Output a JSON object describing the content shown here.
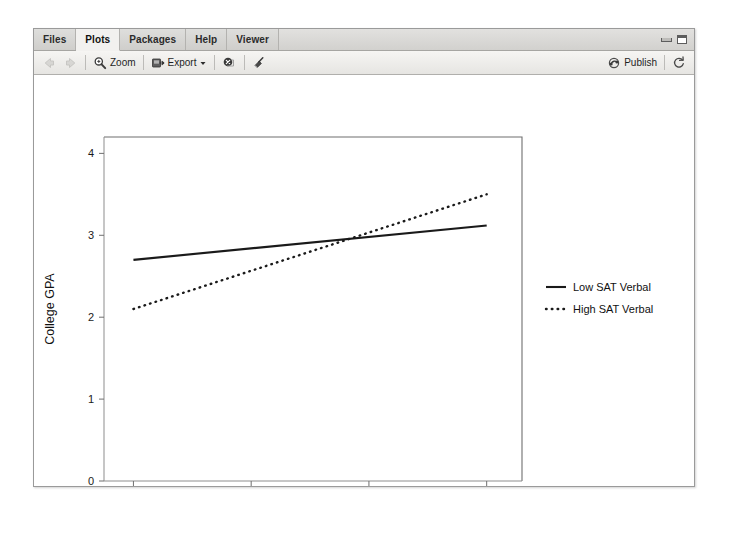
{
  "window": {
    "tabs": [
      {
        "label": "Files",
        "active": false
      },
      {
        "label": "Plots",
        "active": true
      },
      {
        "label": "Packages",
        "active": false
      },
      {
        "label": "Help",
        "active": false
      },
      {
        "label": "Viewer",
        "active": false
      }
    ],
    "minimize_icon": "minimize-icon",
    "maximize_icon": "maximize-icon"
  },
  "toolbar": {
    "back_icon": "back-arrow-icon",
    "forward_icon": "forward-arrow-icon",
    "zoom_label": "Zoom",
    "zoom_icon": "magnifier-icon",
    "export_label": "Export",
    "export_icon": "export-icon",
    "export_caret": "chevron-down-icon",
    "remove_plot_icon": "remove-plot-icon",
    "clear_plots_icon": "broom-icon",
    "publish_label": "Publish",
    "publish_icon": "publish-icon",
    "refresh_icon": "refresh-icon"
  },
  "chart_data": {
    "type": "line",
    "title": "",
    "xlabel": "SAT Math",
    "ylabel": "College GPA",
    "xlim": [
      150,
      860
    ],
    "ylim": [
      0,
      4.2
    ],
    "xticks": [
      200,
      400,
      600,
      800
    ],
    "yticks": [
      0,
      1,
      2,
      3,
      4
    ],
    "xtick_labels": [
      "200",
      "400",
      "600",
      "800"
    ],
    "ytick_labels": [
      "0",
      "1",
      "2",
      "3",
      "4"
    ],
    "grid": false,
    "legend_position": "right",
    "series": [
      {
        "name": "Low SAT Verbal",
        "style": "solid",
        "color": "#1a1a1a",
        "x": [
          200,
          800
        ],
        "y": [
          2.7,
          3.12
        ]
      },
      {
        "name": "High SAT Verbal",
        "style": "dotted",
        "color": "#1a1a1a",
        "x": [
          200,
          800
        ],
        "y": [
          2.1,
          3.5
        ]
      }
    ],
    "annotations": []
  }
}
